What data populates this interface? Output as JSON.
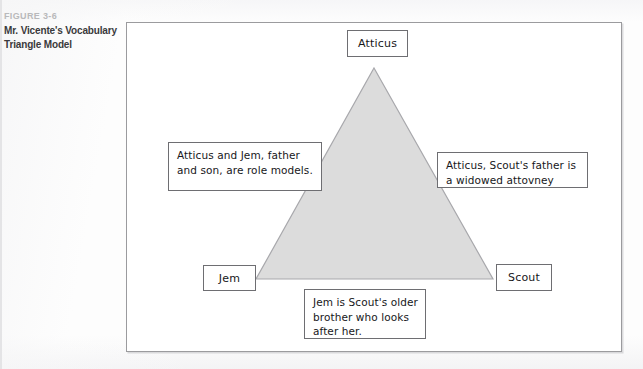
{
  "caption": {
    "figure_number": "FIGURE 3-6",
    "title": "Mr. Vicente's Vocabulary Triangle Model"
  },
  "figure": {
    "nodes": [
      {
        "id": "atticus",
        "label": "Atticus"
      },
      {
        "id": "jem",
        "label": "Jem"
      },
      {
        "id": "scout",
        "label": "Scout"
      }
    ],
    "notes": [
      {
        "id": "left",
        "text": "Atticus and Jem, father and son, are role models."
      },
      {
        "id": "right",
        "text": "Atticus, Scout's father is a widowed attovney"
      },
      {
        "id": "bottom",
        "text": "Jem is Scout's older brother who looks after her."
      }
    ],
    "shape": {
      "name": "triangle",
      "fill": "#dcdcdc",
      "stroke": "#a8a8ac"
    },
    "frame": {
      "border_color": "#9b9b9e",
      "background": "#ffffff"
    }
  },
  "colors": {
    "page_background": "#fdfdfd",
    "caption_number": "#b9b9bb",
    "caption_title": "#3a3a3c",
    "box_border": "#6e6e72",
    "text": "#17171a"
  }
}
